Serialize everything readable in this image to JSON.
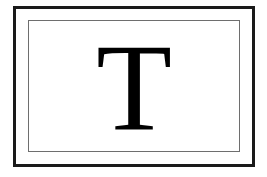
{
  "icon": {
    "letter": "T",
    "semantic": "text-tool-icon",
    "colors": {
      "outer_border": "#1a1a1a",
      "inner_border": "#6e6e6e",
      "glyph": "#000000",
      "background": "#ffffff"
    }
  }
}
